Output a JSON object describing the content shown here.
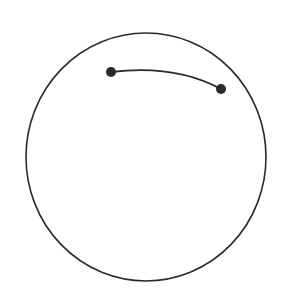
{
  "diagram": {
    "background": "#ffffff",
    "stroke_color": "#2a2a2a",
    "circle": {
      "cx": 146,
      "cy": 157,
      "rx": 120,
      "ry": 124,
      "stroke_width": 1.6
    },
    "arc": {
      "start": [
        111,
        72
      ],
      "control": [
        175,
        64
      ],
      "end": [
        221,
        89
      ],
      "stroke_width": 1.8
    },
    "points": [
      {
        "x": 111,
        "y": 72,
        "r": 5
      },
      {
        "x": 221,
        "y": 89,
        "r": 5
      }
    ]
  }
}
